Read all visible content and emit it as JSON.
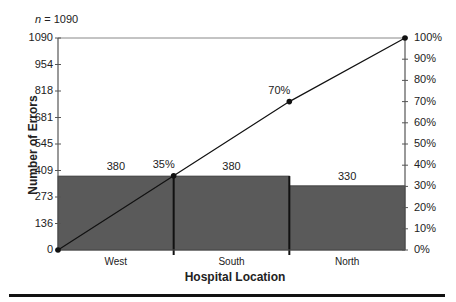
{
  "chart_data": {
    "type": "bar",
    "subtype": "pareto",
    "n_label": "n = 1090",
    "categories": [
      "West",
      "South",
      "North"
    ],
    "values": [
      380,
      380,
      330
    ],
    "value_labels": [
      "380",
      "380",
      "330"
    ],
    "cumulative_percent": [
      0,
      35,
      70,
      100
    ],
    "cumulative_labels": [
      "35%",
      "70%"
    ],
    "xlabel": "Hospital Location",
    "ylabel": "Number of Errors",
    "ylim": [
      0,
      1090
    ],
    "y_ticks": [
      "0",
      "136",
      "273",
      "409",
      "545",
      "681",
      "818",
      "954",
      "1090"
    ],
    "y2lim": [
      0,
      100
    ],
    "y2_ticks": [
      "0%",
      "10%",
      "20%",
      "30%",
      "40%",
      "50%",
      "60%",
      "70%",
      "80%",
      "90%",
      "100%"
    ],
    "grid": false,
    "bar_color": "#5a5a5a",
    "line_color": "#111111"
  }
}
